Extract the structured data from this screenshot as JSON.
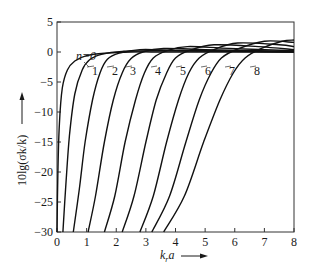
{
  "chart_data": {
    "type": "line",
    "title": "",
    "xlabel": "k_r a",
    "ylabel": "10lg(σk/k)",
    "xlim": [
      0,
      8
    ],
    "ylim": [
      -30,
      5
    ],
    "x_ticks": [
      "0",
      "1",
      "2",
      "3",
      "4",
      "5",
      "6",
      "7",
      "8"
    ],
    "y_ticks": [
      "5",
      "0",
      "-5",
      "-10",
      "-15",
      "-20",
      "-25",
      "-30"
    ],
    "grid": false,
    "legend": "inline curve labels",
    "series": [
      {
        "name": "n=0",
        "label": "n=0",
        "points": [
          [
            0.0,
            -30
          ],
          [
            0.03,
            -20
          ],
          [
            0.08,
            -12
          ],
          [
            0.18,
            -6
          ],
          [
            0.35,
            -3
          ],
          [
            0.6,
            -1.5
          ],
          [
            1.0,
            -0.6
          ],
          [
            1.6,
            -0.2
          ],
          [
            2.5,
            0
          ],
          [
            4,
            0
          ],
          [
            8,
            0
          ]
        ]
      },
      {
        "name": "n=1",
        "label": "1",
        "points": [
          [
            0.2,
            -30
          ],
          [
            0.3,
            -22
          ],
          [
            0.42,
            -14
          ],
          [
            0.6,
            -7
          ],
          [
            0.85,
            -3
          ],
          [
            1.1,
            -1.3
          ],
          [
            1.5,
            -0.4
          ],
          [
            2.2,
            0.1
          ],
          [
            3.5,
            0.2
          ],
          [
            8,
            0
          ]
        ]
      },
      {
        "name": "n=2",
        "label": "2",
        "points": [
          [
            0.55,
            -30
          ],
          [
            0.75,
            -23
          ],
          [
            0.95,
            -15
          ],
          [
            1.2,
            -8
          ],
          [
            1.45,
            -3.5
          ],
          [
            1.7,
            -1.2
          ],
          [
            2.1,
            -0.2
          ],
          [
            2.8,
            0.4
          ],
          [
            4,
            0.3
          ],
          [
            8,
            0
          ]
        ]
      },
      {
        "name": "n=3",
        "label": "3",
        "points": [
          [
            1.05,
            -30
          ],
          [
            1.3,
            -24
          ],
          [
            1.6,
            -15
          ],
          [
            1.9,
            -8
          ],
          [
            2.2,
            -3.5
          ],
          [
            2.5,
            -1.1
          ],
          [
            2.9,
            0
          ],
          [
            3.6,
            0.6
          ],
          [
            5,
            0.4
          ],
          [
            8,
            0.1
          ]
        ]
      },
      {
        "name": "n=4",
        "label": "4",
        "points": [
          [
            1.6,
            -30
          ],
          [
            1.95,
            -24
          ],
          [
            2.3,
            -15
          ],
          [
            2.65,
            -8
          ],
          [
            2.95,
            -3.5
          ],
          [
            3.25,
            -1
          ],
          [
            3.7,
            0.2
          ],
          [
            4.4,
            0.9
          ],
          [
            5.8,
            0.6
          ],
          [
            8,
            0.2
          ]
        ]
      },
      {
        "name": "n=5",
        "label": "5",
        "points": [
          [
            2.2,
            -30
          ],
          [
            2.6,
            -24
          ],
          [
            3.0,
            -15
          ],
          [
            3.35,
            -8
          ],
          [
            3.7,
            -3.5
          ],
          [
            4.0,
            -1
          ],
          [
            4.5,
            0.3
          ],
          [
            5.3,
            1.2
          ],
          [
            6.8,
            0.9
          ],
          [
            8,
            0.4
          ]
        ]
      },
      {
        "name": "n=6",
        "label": "6",
        "points": [
          [
            2.8,
            -30
          ],
          [
            3.25,
            -24
          ],
          [
            3.7,
            -15
          ],
          [
            4.1,
            -8
          ],
          [
            4.45,
            -3.5
          ],
          [
            4.8,
            -1
          ],
          [
            5.3,
            0.4
          ],
          [
            6.1,
            1.5
          ],
          [
            7.5,
            1.2
          ],
          [
            8,
            0.9
          ]
        ]
      },
      {
        "name": "n=7",
        "label": "7",
        "points": [
          [
            3.2,
            -30
          ],
          [
            3.8,
            -24
          ],
          [
            4.35,
            -15
          ],
          [
            4.8,
            -8
          ],
          [
            5.2,
            -3.5
          ],
          [
            5.55,
            -1
          ],
          [
            6.1,
            0.5
          ],
          [
            7.0,
            1.8
          ],
          [
            8,
            1.6
          ]
        ]
      },
      {
        "name": "n=8",
        "label": "8",
        "points": [
          [
            3.6,
            -30
          ],
          [
            4.3,
            -24
          ],
          [
            4.95,
            -15
          ],
          [
            5.5,
            -8
          ],
          [
            5.95,
            -3.5
          ],
          [
            6.35,
            -1
          ],
          [
            6.9,
            0.6
          ],
          [
            7.6,
            1.8
          ],
          [
            8,
            2.0
          ]
        ]
      }
    ]
  },
  "axes": {
    "x_label_text": "k",
    "x_label_sub": "r",
    "x_label_tail": "a",
    "y_label": "10lg(σk/k)"
  }
}
